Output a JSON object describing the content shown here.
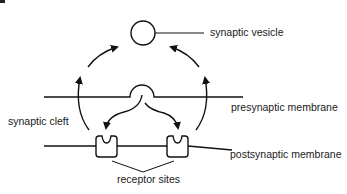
{
  "diagram": {
    "labels": {
      "synaptic_vesicle": "synaptic vesicle",
      "presynaptic_membrane": "presynaptic membrane",
      "synaptic_cleft": "synaptic cleft",
      "postsynaptic_membrane": "postsynaptic membrane",
      "receptor_sites": "receptor sites"
    },
    "components": [
      {
        "id": "synaptic-vesicle",
        "shape": "circle"
      },
      {
        "id": "presynaptic-membrane",
        "shape": "line-with-fusing-vesicle"
      },
      {
        "id": "postsynaptic-membrane",
        "shape": "line"
      },
      {
        "id": "receptor-left",
        "shape": "notched-rounded-rect"
      },
      {
        "id": "receptor-right",
        "shape": "notched-rounded-rect"
      }
    ],
    "arrows": [
      {
        "from": "fusing-vesicle",
        "to": "receptor-left",
        "meaning": "neurotransmitter release"
      },
      {
        "from": "fusing-vesicle",
        "to": "receptor-right",
        "meaning": "neurotransmitter release"
      },
      {
        "from": "receptor-left",
        "to": "synaptic-vesicle",
        "meaning": "recycling (left loop)"
      },
      {
        "from": "receptor-right",
        "to": "synaptic-vesicle",
        "meaning": "recycling (right loop)"
      }
    ],
    "colors": {
      "stroke": "#111111",
      "background": "#ffffff",
      "text": "#1a1a1a"
    }
  }
}
